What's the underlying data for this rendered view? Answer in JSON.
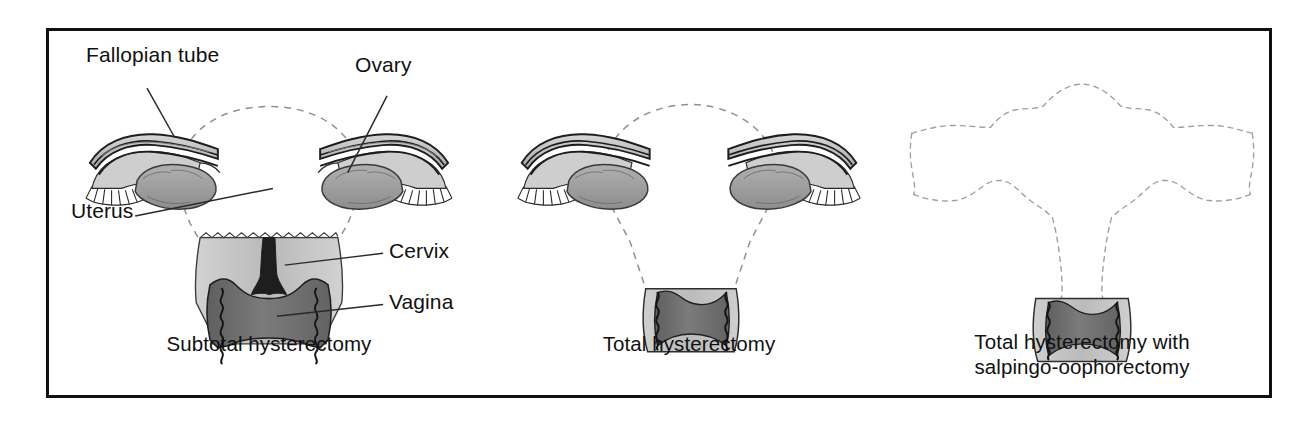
{
  "figure": {
    "type": "medical-anatomy-diagram",
    "border_color": "#111111",
    "background_color": "#ffffff",
    "ink_color": "#111111"
  },
  "palette": {
    "outline": "#1a1a1a",
    "tube_light": "#c9c9c9",
    "tube_mid": "#a8a8a8",
    "ovary_gray": "#9a9a9a",
    "cervix_light": "#bfbfbf",
    "vagina_dark": "#6f6f6f",
    "canal_black": "#1c1c1c",
    "dashed_removed": "#9b9b9b",
    "leader_line": "#2a2a2a"
  },
  "labels": {
    "fallopian_tube": "Fallopian tube",
    "ovary": "Ovary",
    "uterus": "Uterus",
    "cervix": "Cervix",
    "vagina": "Vagina"
  },
  "panels": [
    {
      "id": "subtotal",
      "caption": "Subtotal hysterectomy",
      "retained": [
        "Fallopian tube",
        "Ovary",
        "Cervix",
        "Vagina"
      ],
      "removed": [
        "Uterus body"
      ],
      "dashed_outline": "uterine body"
    },
    {
      "id": "total",
      "caption": "Total hysterectomy",
      "retained": [
        "Fallopian tube",
        "Ovary",
        "Vagina"
      ],
      "removed": [
        "Uterus body",
        "Cervix"
      ],
      "dashed_outline": "uterine body and cervix"
    },
    {
      "id": "total-with-bso",
      "caption_line_1": "Total hysterectomy with",
      "caption_line_2": "salpingo-oophorectomy",
      "caption": "Total hysterectomy with salpingo-oophorectomy",
      "retained": [
        "Vagina"
      ],
      "removed": [
        "Uterus body",
        "Cervix",
        "Fallopian tubes",
        "Ovaries"
      ],
      "dashed_outline": "uterus, tubes and ovaries"
    }
  ]
}
